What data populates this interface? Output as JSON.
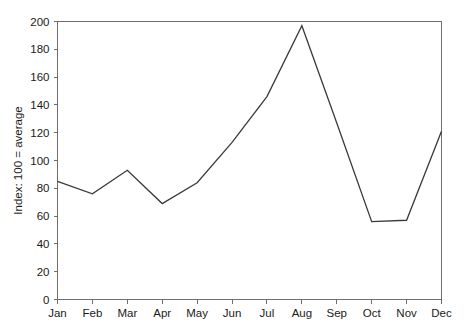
{
  "chart_data": {
    "type": "line",
    "title": "",
    "xlabel": "",
    "ylabel": "Index: 100 = average",
    "categories": [
      "Jan",
      "Feb",
      "Mar",
      "Apr",
      "May",
      "Jun",
      "Jul",
      "Aug",
      "Sep",
      "Oct",
      "Nov",
      "Dec"
    ],
    "values": [
      85,
      76,
      93,
      69,
      84,
      113,
      146,
      197,
      127,
      56,
      57,
      121
    ],
    "series": [
      {
        "name": "Index",
        "values": [
          85,
          76,
          93,
          69,
          84,
          113,
          146,
          197,
          127,
          56,
          57,
          121
        ]
      }
    ],
    "ylim": [
      0,
      200
    ],
    "y_ticks": [
      0,
      20,
      40,
      60,
      80,
      100,
      120,
      140,
      160,
      180,
      200
    ],
    "y_tick_labels": [
      "0",
      "20",
      "40",
      "60",
      "80",
      "100",
      "120",
      "140",
      "160",
      "180",
      "200"
    ],
    "x_tick_labels": [
      "Jan",
      "Feb",
      "Mar",
      "Apr",
      "May",
      "Jun",
      "Jul",
      "Aug",
      "Sep",
      "Oct",
      "Nov",
      "Dec"
    ],
    "grid": false,
    "legend": "none",
    "line_color": "#3a3a3a",
    "axis_color": "#6f6f6f",
    "background_color": "#ffffff"
  }
}
